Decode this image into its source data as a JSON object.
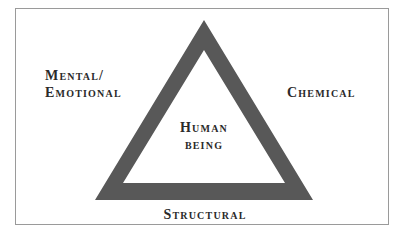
{
  "diagram": {
    "type": "triangle",
    "colors": {
      "triangle_fill": "#585858",
      "frame_border": "#9a9a9a",
      "background": "#ffffff",
      "text": "#2a2a2a"
    },
    "center_label": {
      "line1": "Human",
      "line2": "being"
    },
    "vertices": {
      "left": {
        "line1": "Mental/",
        "line2": "Emotional"
      },
      "right": {
        "line1": "Chemical"
      },
      "bottom": {
        "line1": "Structural"
      }
    }
  }
}
